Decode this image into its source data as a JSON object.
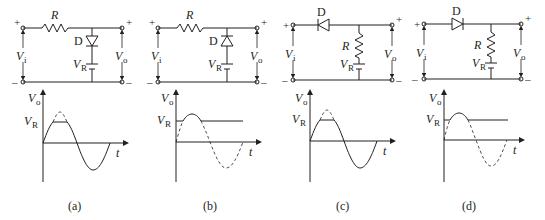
{
  "figure": {
    "panels": [
      {
        "id": "a",
        "caption": "(a)",
        "circuit": {
          "input_label": "V",
          "input_sub": "i",
          "output_label": "V",
          "output_sub": "o",
          "resistor_label": "R",
          "diode_label": "D",
          "source_label": "V",
          "source_sub": "R",
          "plus": "+",
          "minus": "–",
          "topology": "series R, shunt diode (anode up) + VR to ground"
        },
        "graph": {
          "y_label": "V",
          "y_sub": "o",
          "x_label": "t",
          "level_label": "V",
          "level_sub": "R",
          "clip": "top clipped at VR, negative half passes"
        }
      },
      {
        "id": "b",
        "caption": "(b)",
        "circuit": {
          "input_label": "V",
          "input_sub": "i",
          "output_label": "V",
          "output_sub": "o",
          "resistor_label": "R",
          "diode_label": "D",
          "source_label": "V",
          "source_sub": "R",
          "plus": "+",
          "minus": "–",
          "topology": "series R, shunt diode (cathode up) + VR to ground"
        },
        "graph": {
          "y_label": "V",
          "y_sub": "o",
          "x_label": "t",
          "level_label": "V",
          "level_sub": "R",
          "clip": "bottom clipped at VR, peak above passes"
        }
      },
      {
        "id": "c",
        "caption": "(c)",
        "circuit": {
          "input_label": "V",
          "input_sub": "i",
          "output_label": "V",
          "output_sub": "o",
          "resistor_label": "R",
          "diode_label": "D",
          "source_label": "V",
          "source_sub": "R",
          "plus": "+",
          "minus": "–",
          "topology": "series diode (pointing left), shunt R + VR to ground"
        },
        "graph": {
          "y_label": "V",
          "y_sub": "o",
          "x_label": "t",
          "level_label": "V",
          "level_sub": "R",
          "clip": "top clipped at VR, negative half passes"
        }
      },
      {
        "id": "d",
        "caption": "(d)",
        "circuit": {
          "input_label": "V",
          "input_sub": "i",
          "output_label": "V",
          "output_sub": "o",
          "resistor_label": "R",
          "diode_label": "D",
          "source_label": "V",
          "source_sub": "R",
          "plus": "+",
          "minus": "–",
          "topology": "series diode (pointing right), shunt R + VR to ground"
        },
        "graph": {
          "y_label": "V",
          "y_sub": "o",
          "x_label": "t",
          "level_label": "V",
          "level_sub": "R",
          "clip": "bottom clipped at VR, peak above passes"
        }
      }
    ]
  }
}
